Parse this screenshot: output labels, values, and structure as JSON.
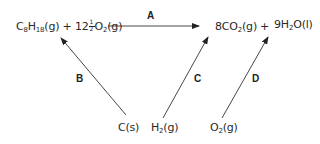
{
  "diagram": {
    "type": "thermochemical-cycle",
    "reactants": {
      "octane": {
        "formula": "C",
        "sub1": "8",
        "mid": "H",
        "sub2": "18",
        "state": "(g)"
      },
      "plus": "+",
      "oxygen": {
        "coef_whole": "12",
        "coef_num": "1",
        "coef_den": "2",
        "formula": "O",
        "sub": "2",
        "state": "(g)"
      }
    },
    "products": {
      "co2": {
        "coef": "8",
        "formula": "CO",
        "sub": "2",
        "state": "(g)"
      },
      "plus": "+",
      "h2o": {
        "coef": "9",
        "formula": "H",
        "sub": "2",
        "tail": "O",
        "state": "(l)"
      }
    },
    "elements": {
      "carbon": {
        "formula": "C",
        "state": "(s)"
      },
      "hydrogen": {
        "formula": "H",
        "sub": "2",
        "state": "(g)"
      },
      "oxygen": {
        "formula": "O",
        "sub": "2",
        "state": "(g)"
      }
    },
    "arrows": [
      {
        "label": "A",
        "from": "reactants",
        "to": "products"
      },
      {
        "label": "B",
        "from": "C(s)",
        "to": "reactants"
      },
      {
        "label": "C",
        "from": "H2(g)",
        "to": "8CO2(g)"
      },
      {
        "label": "D",
        "from": "O2(g)",
        "to": "9H2O(l)"
      }
    ],
    "colors": {
      "line": "#333333",
      "text": "#2a2a2a"
    }
  }
}
